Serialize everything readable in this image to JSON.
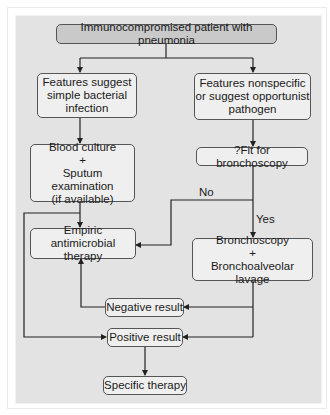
{
  "diagram": {
    "type": "flowchart",
    "nodes": {
      "start": {
        "lines": [
          "Immunocompromised patient with pneumonia"
        ]
      },
      "bacterial": {
        "lines": [
          "Features suggest",
          "simple bacterial",
          "infection"
        ]
      },
      "nonspecific": {
        "lines": [
          "Features nonspecific",
          "or suggest opportunist",
          "pathogen"
        ]
      },
      "cultures": {
        "lines": [
          "Blood culture",
          "+",
          "Sputum examination",
          "(if available)"
        ]
      },
      "fit": {
        "lines": [
          "?Fit for bronchoscopy"
        ]
      },
      "empiric": {
        "lines": [
          "Empiric antimicrobial",
          "therapy"
        ]
      },
      "bronch": {
        "lines": [
          "Bronchoscopy",
          "+",
          "Bronchoalveolar lavage"
        ]
      },
      "negative": {
        "lines": [
          "Negative result"
        ]
      },
      "positive": {
        "lines": [
          "Positive result"
        ]
      },
      "specific": {
        "lines": [
          "Specific therapy"
        ]
      }
    },
    "edge_labels": {
      "no": "No",
      "yes": "Yes"
    },
    "edges": [
      {
        "from": "start",
        "to": "bacterial"
      },
      {
        "from": "start",
        "to": "nonspecific"
      },
      {
        "from": "bacterial",
        "to": "cultures"
      },
      {
        "from": "nonspecific",
        "to": "fit"
      },
      {
        "from": "cultures",
        "to": "empiric"
      },
      {
        "from": "cultures",
        "to": "positive"
      },
      {
        "from": "fit",
        "to": "empiric",
        "label": "No"
      },
      {
        "from": "fit",
        "to": "bronch",
        "label": "Yes"
      },
      {
        "from": "bronch",
        "to": "negative"
      },
      {
        "from": "bronch",
        "to": "positive"
      },
      {
        "from": "negative",
        "to": "empiric"
      },
      {
        "from": "positive",
        "to": "specific"
      }
    ],
    "colors": {
      "background": "#e3e3e3",
      "box_fill": "#efefef",
      "title_fill": "#c9c9c9",
      "line": "#222222"
    }
  }
}
